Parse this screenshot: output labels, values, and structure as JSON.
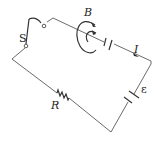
{
  "diagram": {
    "type": "circuit",
    "labels": {
      "switch": "S",
      "magnetic_field": "B",
      "current": "I",
      "emf": "ε",
      "resistor": "R"
    },
    "components": [
      "switch",
      "magnetic-field-loop",
      "gap",
      "current-arrow",
      "battery",
      "resistor"
    ],
    "colors": {
      "wire": "#6b6b6b",
      "text": "#222222",
      "background": "#ffffff"
    }
  }
}
